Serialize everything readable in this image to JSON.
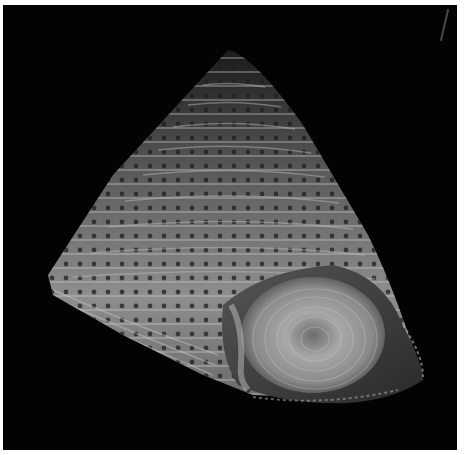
{
  "image": {
    "subject": "conical top snail shell with beaded spiral ridges, viewed from the side with aperture visible",
    "background_color": "#030303",
    "border_color": "#ffffff",
    "shell_tone_light": "#d8d8d8",
    "shell_tone_mid": "#8a8a8a",
    "shell_tone_dark": "#3a3a3a"
  }
}
